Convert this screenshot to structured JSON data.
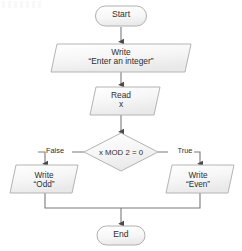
{
  "diagram": {
    "type": "flowchart",
    "background_color": "#ffffff",
    "shape_fill": "#f4f4f4",
    "shape_stroke": "#b4b4b4",
    "connector_color": "#555555",
    "text_color": "#2f2f2f"
  },
  "nodes": {
    "start": {
      "label": "Start",
      "shape": "terminator"
    },
    "write_prompt": {
      "line1": "Write",
      "line2": "“Enter an integer”",
      "shape": "parallelogram"
    },
    "read_x": {
      "line1": "Read",
      "line2": "x",
      "shape": "parallelogram"
    },
    "decision": {
      "label": "x MOD 2 = 0",
      "shape": "diamond"
    },
    "write_odd": {
      "line1": "Write",
      "line2": "“Odd”",
      "shape": "parallelogram"
    },
    "write_even": {
      "line1": "Write",
      "line2": "“Even”",
      "shape": "parallelogram"
    },
    "end": {
      "label": "End",
      "shape": "terminator"
    }
  },
  "edges": {
    "false_label": "False",
    "true_label": "True"
  }
}
